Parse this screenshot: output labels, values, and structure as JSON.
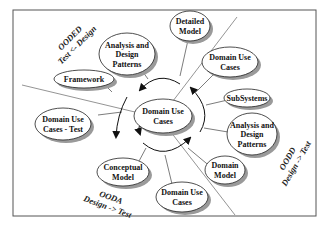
{
  "center": {
    "lines": [
      "Domain Use",
      "Cases"
    ]
  },
  "nodes": [
    {
      "id": "analysis-design-patterns-top",
      "lines": [
        "Analysis and",
        "Design",
        "Patterns"
      ]
    },
    {
      "id": "detailed-model",
      "lines": [
        "Detailed",
        "Model"
      ]
    },
    {
      "id": "domain-use-cases-upper-right",
      "lines": [
        "Domain Use",
        "Cases"
      ]
    },
    {
      "id": "subsystems",
      "lines": [
        "SubSystems"
      ]
    },
    {
      "id": "analysis-design-patterns-right",
      "lines": [
        "Analysis and",
        "Design",
        "Patterns"
      ]
    },
    {
      "id": "domain-model",
      "lines": [
        "Domain",
        "Model"
      ]
    },
    {
      "id": "domain-use-cases-bottom",
      "lines": [
        "Domain Use",
        "Cases"
      ]
    },
    {
      "id": "conceptual-model",
      "lines": [
        "Conceptual",
        "Model"
      ]
    },
    {
      "id": "domain-use-cases-test",
      "lines": [
        "Domain Use",
        "Cases - Test"
      ]
    },
    {
      "id": "framework",
      "lines": [
        "Framework"
      ]
    }
  ],
  "quadrants": [
    {
      "id": "ooded",
      "lines": [
        "OODED",
        "Test <- Design"
      ]
    },
    {
      "id": "oodd",
      "lines": [
        "OODD",
        "Design -> Test"
      ]
    },
    {
      "id": "ooda",
      "lines": [
        "OODA",
        "Design -> Test"
      ]
    }
  ]
}
